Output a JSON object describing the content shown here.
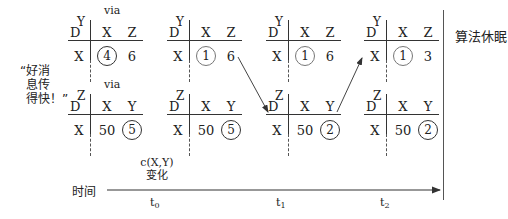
{
  "quote": {
    "lines": [
      "“好消",
      "息传",
      "得快！”"
    ]
  },
  "sleep_label": "算法休眠",
  "timeline": {
    "label": "时间",
    "event_line1": "c(X,Y)",
    "event_line2": "变化",
    "ticks": [
      {
        "base": "t",
        "sub": "0"
      },
      {
        "base": "t",
        "sub": "1"
      },
      {
        "base": "t",
        "sub": "2"
      }
    ]
  },
  "tables": {
    "top": [
      {
        "node": "Y",
        "via": "via",
        "row": "X",
        "cols": [
          "X",
          "Z"
        ],
        "vals": [
          "4",
          "6"
        ],
        "circled": 0
      },
      {
        "node": "Y",
        "via": "",
        "row": "X",
        "cols": [
          "X",
          "Z"
        ],
        "vals": [
          "1",
          "6"
        ],
        "circled": 0
      },
      {
        "node": "Y",
        "via": "",
        "row": "X",
        "cols": [
          "X",
          "Z"
        ],
        "vals": [
          "1",
          "6"
        ],
        "circled": 0
      },
      {
        "node": "Y",
        "via": "",
        "row": "X",
        "cols": [
          "X",
          "Z"
        ],
        "vals": [
          "1",
          "3"
        ],
        "circled": 0
      }
    ],
    "bottom": [
      {
        "node": "Z",
        "via": "via",
        "row": "X",
        "cols": [
          "X",
          "Y"
        ],
        "vals": [
          "50",
          "5"
        ],
        "circled": 1
      },
      {
        "node": "Z",
        "via": "",
        "row": "X",
        "cols": [
          "X",
          "Y"
        ],
        "vals": [
          "50",
          "5"
        ],
        "circled": 1
      },
      {
        "node": "Z",
        "via": "",
        "row": "X",
        "cols": [
          "X",
          "Y"
        ],
        "vals": [
          "50",
          "2"
        ],
        "circled": 1
      },
      {
        "node": "Z",
        "via": "",
        "row": "X",
        "cols": [
          "X",
          "Y"
        ],
        "vals": [
          "50",
          "2"
        ],
        "circled": 1
      }
    ]
  },
  "d_label": "D"
}
